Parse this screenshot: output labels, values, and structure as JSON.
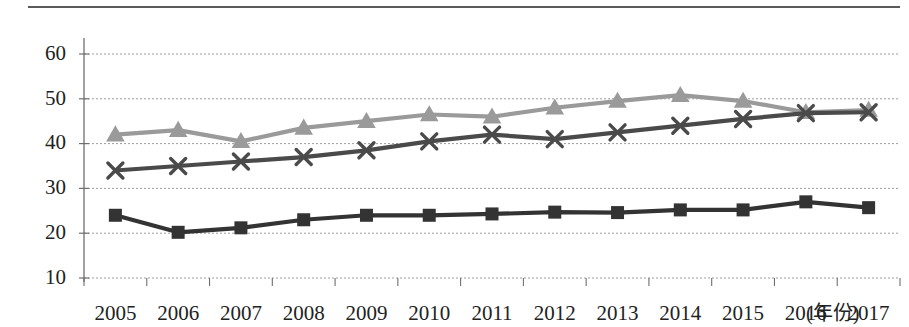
{
  "chart_data": {
    "type": "line",
    "title": "",
    "subtitle": "",
    "xlabel": "(年份)",
    "ylabel": "",
    "categories": [
      "2005",
      "2006",
      "2007",
      "2008",
      "2009",
      "2010",
      "2011",
      "2012",
      "2013",
      "2014",
      "2015",
      "2016",
      "2017"
    ],
    "ylim": [
      10,
      60
    ],
    "yticks": [
      10,
      20,
      30,
      40,
      50,
      60
    ],
    "ytick_labels": [
      "10",
      "20",
      "30",
      "40",
      "50",
      "60"
    ],
    "grid": "horizontal-dotted",
    "legend": "none",
    "series": [
      {
        "name": "series-triangle-gray",
        "marker": "triangle",
        "color": "#9a9a9a",
        "values": [
          42.0,
          43.0,
          40.5,
          43.5,
          45.0,
          46.5,
          46.0,
          48.0,
          49.5,
          50.8,
          49.5,
          47.0,
          47.5
        ]
      },
      {
        "name": "series-x-dark",
        "marker": "x",
        "color": "#4a4a4a",
        "values": [
          34.0,
          35.0,
          36.0,
          37.0,
          38.5,
          40.5,
          42.0,
          41.0,
          42.5,
          44.0,
          45.5,
          46.8,
          47.0
        ]
      },
      {
        "name": "series-square-dark",
        "marker": "square",
        "color": "#333333",
        "values": [
          24.0,
          20.2,
          21.2,
          23.0,
          24.0,
          24.0,
          24.3,
          24.7,
          24.6,
          25.2,
          25.2,
          27.0,
          25.7
        ]
      }
    ]
  },
  "axis": {
    "x_unit_label": "(年份)"
  },
  "colors": {
    "gridline": "#9d9d9d",
    "axis": "#6f6f6f",
    "rule": "#5a5a5a",
    "text": "#222222"
  }
}
